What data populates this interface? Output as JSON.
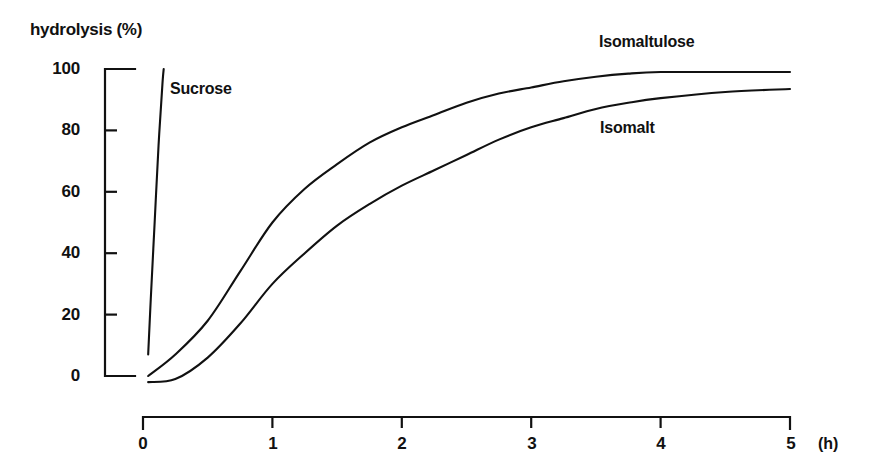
{
  "chart_data": {
    "type": "line",
    "title": "",
    "xlabel": "(h)",
    "ylabel": "hydrolysis (%)",
    "xlim": [
      0,
      5
    ],
    "ylim": [
      0,
      100
    ],
    "xticks": [
      "0",
      "1",
      "2",
      "3",
      "4",
      "5"
    ],
    "yticks": [
      "0",
      "20",
      "40",
      "60",
      "80",
      "100"
    ],
    "grid": false,
    "legend_position": "inline-annotations",
    "x_unit": "(h)",
    "series": [
      {
        "name": "Sucrose",
        "label_x": 2.05,
        "label_y": 92,
        "x": [
          0.04,
          0.06,
          0.09,
          0.12,
          0.15,
          0.16
        ],
        "values": [
          7,
          25,
          50,
          75,
          95,
          100
        ]
      },
      {
        "name": "Isomaltulose",
        "label_x": 3.6,
        "label_y": 105,
        "x": [
          0.04,
          0.25,
          0.5,
          0.75,
          1.0,
          1.25,
          1.5,
          1.75,
          2.0,
          2.25,
          2.5,
          2.75,
          3.0,
          3.25,
          3.5,
          3.75,
          4.0,
          4.5,
          5.0
        ],
        "values": [
          0,
          7,
          18,
          34,
          50,
          61,
          69,
          76,
          81,
          85,
          89,
          92,
          94,
          96,
          97.5,
          98.5,
          99,
          99,
          99
        ]
      },
      {
        "name": "Isomalt",
        "label_x": 3.6,
        "label_y": 79,
        "x": [
          0.04,
          0.25,
          0.5,
          0.75,
          1.0,
          1.25,
          1.5,
          1.75,
          2.0,
          2.25,
          2.5,
          2.75,
          3.0,
          3.25,
          3.5,
          3.75,
          4.0,
          4.5,
          5.0
        ],
        "values": [
          -2,
          -1,
          6,
          17,
          30,
          40,
          49,
          56,
          62,
          67,
          72,
          77,
          81,
          84,
          87,
          89,
          90.5,
          92.5,
          93.5
        ]
      }
    ]
  },
  "axis": {
    "y_title": "hydrolysis (%)",
    "y_tick_100": "100",
    "y_tick_80": "80",
    "y_tick_60": "60",
    "y_tick_40": "40",
    "y_tick_20": "20",
    "y_tick_0": "0",
    "x_tick_0": "0",
    "x_tick_1": "1",
    "x_tick_2": "2",
    "x_tick_3": "3",
    "x_tick_4": "4",
    "x_tick_5": "5",
    "x_unit": "(h)"
  },
  "annotations": {
    "sucrose": "Sucrose",
    "isomaltulose": "Isomaltulose",
    "isomalt": "Isomalt"
  },
  "colors": {
    "ink": "#111111",
    "background": "#ffffff"
  }
}
